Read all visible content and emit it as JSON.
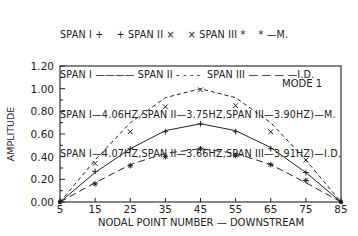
{
  "legend": {
    "line1": "SPAN I +    + SPAN II ×    × SPAN III *    * —M.",
    "line2": "SPAN I ———— SPAN II - - - -  SPAN III — — — —I.D.",
    "line3": "SPAN I—4.06HZ,SPAN II—3.75HZ,SPAN III—3.90HZ)—M.",
    "line4": "SPAN I—4.07HZ,SPAN II—3.66HZ,SPAN III—3.91HZ)—I.D."
  },
  "chart_data": {
    "type": "line",
    "title": "MODE 1",
    "xlabel": "NODAL POINT NUMBER — DOWNSTREAM",
    "ylabel": "AMPLITUDE",
    "xlim": [
      5,
      85
    ],
    "ylim": [
      0,
      1.2
    ],
    "x_ticks": [
      5,
      15,
      25,
      35,
      45,
      55,
      65,
      75,
      85
    ],
    "y_ticks": [
      "0.00",
      "0.20",
      "0.40",
      "0.60",
      "0.80",
      "1.00",
      "1.20"
    ],
    "grid": false,
    "annotation": "MODE 1",
    "x": [
      5,
      15,
      25,
      35,
      45,
      55,
      65,
      75,
      85
    ],
    "series": [
      {
        "name": "SPAN I — M.",
        "kind": "marker",
        "marker": "+",
        "values": [
          0,
          0.27,
          0.47,
          0.62,
          0.69,
          0.62,
          0.47,
          0.26,
          0
        ]
      },
      {
        "name": "SPAN II — M.",
        "kind": "marker",
        "marker": "x",
        "values": [
          0,
          0.34,
          0.62,
          0.84,
          0.99,
          0.85,
          0.62,
          0.37,
          0
        ]
      },
      {
        "name": "SPAN III — M.",
        "kind": "marker",
        "marker": "*",
        "values": [
          0,
          0.16,
          0.32,
          0.4,
          0.47,
          0.41,
          0.33,
          0.19,
          0
        ]
      },
      {
        "name": "SPAN I — I.D.",
        "kind": "line",
        "style": "solid",
        "values": [
          0,
          0.26,
          0.47,
          0.63,
          0.69,
          0.63,
          0.48,
          0.26,
          0
        ]
      },
      {
        "name": "SPAN II — I.D.",
        "kind": "line",
        "style": "short-dash",
        "values": [
          0,
          0.37,
          0.7,
          0.92,
          1.0,
          0.92,
          0.7,
          0.37,
          0
        ]
      },
      {
        "name": "SPAN III — I.D.",
        "kind": "line",
        "style": "long-dash",
        "values": [
          0,
          0.17,
          0.33,
          0.43,
          0.47,
          0.43,
          0.33,
          0.17,
          0
        ]
      }
    ],
    "frequencies": {
      "measured": {
        "SPAN I": "4.06HZ",
        "SPAN II": "3.75HZ",
        "SPAN III": "3.90HZ"
      },
      "identified": {
        "SPAN I": "4.07HZ",
        "SPAN II": "3.66HZ",
        "SPAN III": "3.91HZ"
      }
    }
  }
}
